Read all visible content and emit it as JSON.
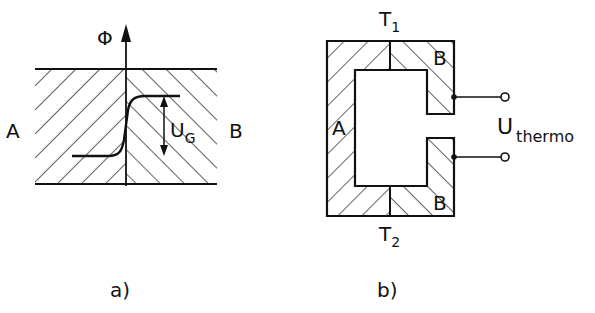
{
  "figure_a": {
    "caption": "a)",
    "axis_label": "Φ",
    "left_material": "A",
    "right_material": "B",
    "step_label_main": "U",
    "step_label_sub": "G"
  },
  "figure_b": {
    "caption": "b)",
    "top_label_main": "T",
    "top_label_sub": "1",
    "bottom_label_main": "T",
    "bottom_label_sub": "2",
    "left_material": "A",
    "right_top_material": "B",
    "right_bottom_material": "B",
    "voltage_label_main": "U",
    "voltage_label_sub": "thermo"
  },
  "colors": {
    "ink": "#111111",
    "background": "#ffffff"
  }
}
